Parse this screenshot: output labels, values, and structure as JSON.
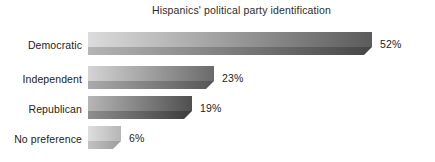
{
  "chart_data": {
    "type": "bar",
    "orientation": "horizontal",
    "title": "Hispanics' political party identification",
    "xlabel": "",
    "ylabel": "",
    "categories": [
      "Democratic",
      "Independent",
      "Republican",
      "No preference"
    ],
    "values": [
      52,
      23,
      19,
      6
    ],
    "value_labels": [
      "52%",
      "23%",
      "19%",
      "6%"
    ],
    "value_unit": "%",
    "xlim": [
      0,
      52
    ],
    "grid": false,
    "legend": null,
    "axis_visible": false,
    "style": {
      "background": "#ffffff",
      "title_color": "#2b2b2b",
      "label_color": "#1d1d1d",
      "bar_fill_light": "#d8d8d8",
      "bar_fill_dark": "#4d4d4d",
      "bar_shadow_light": "#b9b9b9",
      "bar_shadow_dark": "#3a3a3a"
    },
    "bars": [
      {
        "category": "Democratic",
        "value": 52,
        "label": "52%",
        "top_gradient": [
          "#dcdcdc",
          "#5b5b5b"
        ],
        "bottom_gradient": [
          "#b5b5b5",
          "#464646"
        ]
      },
      {
        "category": "Independent",
        "value": 23,
        "label": "23%",
        "top_gradient": [
          "#d4d4d4",
          "#6a6a6a"
        ],
        "bottom_gradient": [
          "#ababab",
          "#555555"
        ]
      },
      {
        "category": "Republican",
        "value": 19,
        "label": "19%",
        "top_gradient": [
          "#b6b6b6",
          "#4f4f4f"
        ],
        "bottom_gradient": [
          "#8f8f8f",
          "#3b3b3b"
        ]
      },
      {
        "category": "No preference",
        "value": 6,
        "label": "6%",
        "top_gradient": [
          "#dedede",
          "#b6b6b6"
        ],
        "bottom_gradient": [
          "#c2c2c2",
          "#9c9c9c"
        ]
      }
    ]
  }
}
